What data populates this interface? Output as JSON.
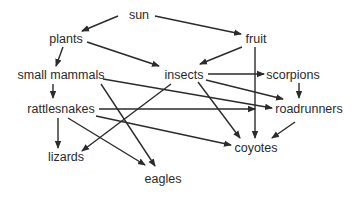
{
  "diagram": {
    "type": "food-web",
    "line_color": "#2b2b2b",
    "text_color": "#2a2a2a",
    "nodes": [
      {
        "id": "sun",
        "label": "sun",
        "x": 139,
        "y": 15
      },
      {
        "id": "plants",
        "label": "plants",
        "x": 66,
        "y": 39
      },
      {
        "id": "fruit",
        "label": "fruit",
        "x": 256,
        "y": 39
      },
      {
        "id": "small_mammals",
        "label": "small mammals",
        "x": 61,
        "y": 75
      },
      {
        "id": "insects",
        "label": "insects",
        "x": 184,
        "y": 75
      },
      {
        "id": "scorpions",
        "label": "scorpions",
        "x": 293,
        "y": 75
      },
      {
        "id": "rattlesnakes",
        "label": "rattlesnakes",
        "x": 61,
        "y": 109
      },
      {
        "id": "roadrunners",
        "label": "roadrunners",
        "x": 309,
        "y": 109
      },
      {
        "id": "coyotes",
        "label": "coyotes",
        "x": 256,
        "y": 148
      },
      {
        "id": "lizards",
        "label": "lizards",
        "x": 66,
        "y": 157
      },
      {
        "id": "eagles",
        "label": "eagles",
        "x": 163,
        "y": 179
      }
    ],
    "edges": [
      {
        "from": "sun",
        "to": "plants",
        "x1": 118,
        "y1": 16,
        "x2": 82,
        "y2": 31
      },
      {
        "from": "sun",
        "to": "fruit",
        "x1": 155,
        "y1": 16,
        "x2": 241,
        "y2": 34
      },
      {
        "from": "plants",
        "to": "small_mammals",
        "x1": 63,
        "y1": 47,
        "x2": 56,
        "y2": 66
      },
      {
        "from": "plants",
        "to": "insects",
        "x1": 87,
        "y1": 42,
        "x2": 159,
        "y2": 66
      },
      {
        "from": "fruit",
        "to": "insects",
        "x1": 242,
        "y1": 47,
        "x2": 200,
        "y2": 64
      },
      {
        "from": "fruit",
        "to": "coyotes",
        "x1": 255,
        "y1": 47,
        "x2": 255,
        "y2": 138
      },
      {
        "from": "insects",
        "to": "scorpions",
        "x1": 208,
        "y1": 74,
        "x2": 264,
        "y2": 74
      },
      {
        "from": "insects",
        "to": "roadrunners",
        "x1": 206,
        "y1": 80,
        "x2": 283,
        "y2": 99
      },
      {
        "from": "insects",
        "to": "coyotes",
        "x1": 198,
        "y1": 82,
        "x2": 240,
        "y2": 138
      },
      {
        "from": "insects",
        "to": "lizards",
        "x1": 171,
        "y1": 84,
        "x2": 82,
        "y2": 151
      },
      {
        "from": "small_mammals",
        "to": "rattlesnakes",
        "x1": 53,
        "y1": 84,
        "x2": 53,
        "y2": 98
      },
      {
        "from": "small_mammals",
        "to": "roadrunners",
        "x1": 103,
        "y1": 79,
        "x2": 272,
        "y2": 108
      },
      {
        "from": "small_mammals",
        "to": "eagles",
        "x1": 101,
        "y1": 84,
        "x2": 155,
        "y2": 166
      },
      {
        "from": "scorpions",
        "to": "roadrunners",
        "x1": 299,
        "y1": 83,
        "x2": 299,
        "y2": 98
      },
      {
        "from": "rattlesnakes",
        "to": "roadrunners",
        "x1": 99,
        "y1": 109,
        "x2": 255,
        "y2": 109
      },
      {
        "from": "rattlesnakes",
        "to": "coyotes",
        "x1": 96,
        "y1": 116,
        "x2": 231,
        "y2": 145
      },
      {
        "from": "rattlesnakes",
        "to": "eagles",
        "x1": 68,
        "y1": 118,
        "x2": 145,
        "y2": 165
      },
      {
        "from": "rattlesnakes",
        "to": "lizards",
        "x1": 58,
        "y1": 118,
        "x2": 58,
        "y2": 148
      },
      {
        "from": "roadrunners",
        "to": "coyotes",
        "x1": 295,
        "y1": 122,
        "x2": 272,
        "y2": 138
      }
    ]
  }
}
